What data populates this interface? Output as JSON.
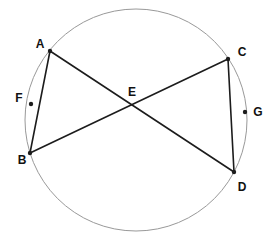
{
  "figure": {
    "background_color": "#ffffff",
    "circle": {
      "cx": 136,
      "cy": 120,
      "r": 111,
      "stroke_color": "#999999",
      "stroke_width": 1
    },
    "style": {
      "chord_color": "#1c1c1c",
      "chord_width": 1.6,
      "dot_color": "#1c1c1c",
      "dot_radius": 2.2,
      "label_color": "#111111",
      "label_font_size": 12
    },
    "points": {
      "A": {
        "label": "A",
        "x": 50,
        "y": 51,
        "label_x": 40,
        "label_y": 48,
        "dot": true
      },
      "B": {
        "label": "B",
        "x": 30,
        "y": 153,
        "label_x": 22,
        "label_y": 164,
        "dot": true
      },
      "C": {
        "label": "C",
        "x": 228,
        "y": 59,
        "label_x": 242,
        "label_y": 56,
        "dot": true
      },
      "D": {
        "label": "D",
        "x": 234,
        "y": 172,
        "label_x": 242,
        "label_y": 191,
        "dot": true
      },
      "E": {
        "label": "E",
        "x": 132,
        "y": 104,
        "label_x": 132,
        "label_y": 96,
        "dot": false
      },
      "F": {
        "label": "F",
        "x": 31,
        "y": 104,
        "label_x": 19,
        "label_y": 102,
        "dot": true
      },
      "G": {
        "label": "G",
        "x": 245,
        "y": 112,
        "label_x": 258,
        "label_y": 116,
        "dot": true
      }
    },
    "segments": [
      {
        "from": "A",
        "to": "B"
      },
      {
        "from": "A",
        "to": "D"
      },
      {
        "from": "B",
        "to": "C"
      },
      {
        "from": "C",
        "to": "D"
      }
    ]
  }
}
